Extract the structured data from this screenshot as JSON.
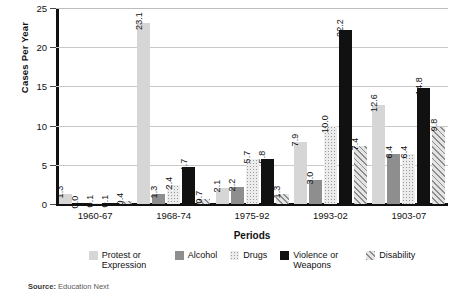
{
  "chart_data": {
    "type": "bar",
    "title": "",
    "xlabel": "Periods",
    "ylabel": "Cases Per Year",
    "ylim": [
      0,
      25
    ],
    "yticks": [
      0,
      5,
      10,
      15,
      20,
      25
    ],
    "grid": true,
    "legend_position": "bottom",
    "categories": [
      "1960-67",
      "1968-74",
      "1975-92",
      "1993-02",
      "1903-07"
    ],
    "series": [
      {
        "name": "Protest or Expression",
        "color": "#d6d6d6",
        "fill": "solid-light-gray",
        "values": [
          1.3,
          23.1,
          2.1,
          7.9,
          12.6
        ]
      },
      {
        "name": "Alcohol",
        "color": "#8e8e8e",
        "fill": "solid-medium-gray",
        "values": [
          0.0,
          1.3,
          2.2,
          3.0,
          6.4
        ]
      },
      {
        "name": "Drugs",
        "color": "#ececec",
        "fill": "dotted",
        "values": [
          0.1,
          2.4,
          5.7,
          10.0,
          6.4
        ]
      },
      {
        "name": "Violence or Weapons",
        "color": "#111111",
        "fill": "solid-black",
        "values": [
          0.1,
          4.7,
          5.8,
          22.2,
          14.8
        ]
      },
      {
        "name": "Disability",
        "color": "#e4e4e4",
        "fill": "diagonal-hatch",
        "values": [
          0.4,
          0.7,
          1.3,
          7.4,
          9.8
        ]
      }
    ],
    "value_labels": [
      [
        "1.3",
        "0.0",
        "0.1",
        "0.1",
        "0.4"
      ],
      [
        "23.1",
        "1.3",
        "2.4",
        "4.7",
        "0.7"
      ],
      [
        "2.1",
        "2.2",
        "5.7",
        "5.8",
        "1.3"
      ],
      [
        "7.9",
        "3.0",
        "10.0",
        "22.2",
        "7.4"
      ],
      [
        "12.6",
        "6.4",
        "6.4",
        "14.8",
        "9.8"
      ]
    ]
  },
  "footer": {
    "source_prefix": "Source:",
    "source_text": "Education Next"
  }
}
